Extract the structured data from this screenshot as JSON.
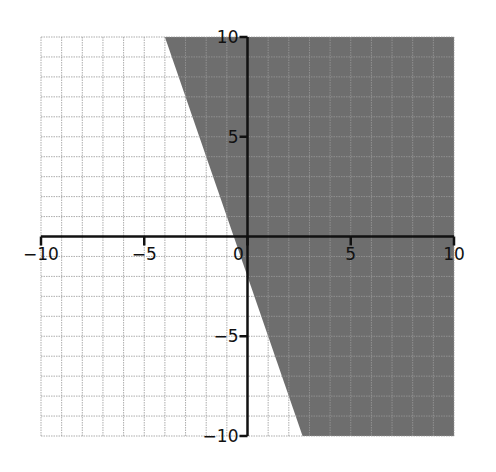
{
  "chart_data": {
    "type": "area",
    "title": "",
    "xlabel": "",
    "ylabel": "",
    "xlim": [
      -10,
      10
    ],
    "ylim": [
      -10,
      10
    ],
    "grid": true,
    "grid_step": 1,
    "x_ticks": [
      -10,
      -5,
      0,
      5,
      10
    ],
    "y_ticks": [
      -10,
      -5,
      5,
      10
    ],
    "x_tick_labels": [
      "−10",
      "−5",
      "0",
      "5",
      "10"
    ],
    "y_tick_labels": [
      "−10",
      "−5",
      "5",
      "10"
    ],
    "boundary_line": {
      "equation": "y = -3x - 2",
      "slope": -3,
      "intercept": -2,
      "style": "solid",
      "points": [
        [
          -4,
          10
        ],
        [
          2.667,
          -10
        ]
      ]
    },
    "shaded_region": {
      "inequality": "y >= -3x - 2",
      "side": "right/above"
    },
    "legend": null
  },
  "colors": {
    "shade": "#6e6e6e",
    "grid": "#9a9a9a",
    "axis": "#111111",
    "background": "#ffffff"
  }
}
